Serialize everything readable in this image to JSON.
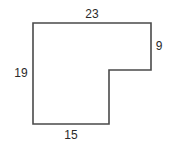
{
  "figure": {
    "type": "L-shaped polygon with side dimensions",
    "stroke_color": "#4a4a4a",
    "label_color": "#2a2a2a",
    "sides": {
      "top": {
        "label": "23",
        "length": 23
      },
      "right_upper": {
        "label": "9",
        "length": 9
      },
      "left": {
        "label": "19",
        "length": 19
      },
      "bottom": {
        "label": "15",
        "length": 15
      }
    }
  }
}
